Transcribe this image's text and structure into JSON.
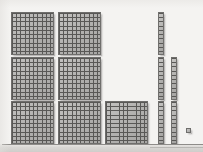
{
  "figure": {
    "title": "Base-ten blocks place value model",
    "description": "Scanned worksheet image showing base-ten manipulative blocks: seven hundred-flats, five ten-rods and one unit cube.",
    "background_color": "#f4f3f1",
    "block_fill_color": "#b4b3b1",
    "grid_line_color": "#595856",
    "block_border_color": "#6f6e6c"
  },
  "blocks": {
    "flats": {
      "label": "hundred-flat",
      "unit_value": 100,
      "count": 7,
      "grid": "10 x 10",
      "items": [
        {
          "name": "flat-1",
          "row": 1,
          "col": 1,
          "x": 11,
          "y": 12
        },
        {
          "name": "flat-2",
          "row": 1,
          "col": 2,
          "x": 58,
          "y": 12
        },
        {
          "name": "flat-3",
          "row": 2,
          "col": 1,
          "x": 11,
          "y": 57
        },
        {
          "name": "flat-4",
          "row": 2,
          "col": 2,
          "x": 58,
          "y": 57
        },
        {
          "name": "flat-5",
          "row": 3,
          "col": 1,
          "x": 11,
          "y": 101
        },
        {
          "name": "flat-6",
          "row": 3,
          "col": 2,
          "x": 58,
          "y": 101
        },
        {
          "name": "flat-7",
          "row": 3,
          "col": 3,
          "x": 105,
          "y": 101
        }
      ]
    },
    "rods": {
      "label": "ten-rod",
      "unit_value": 10,
      "count": 5,
      "grid": "1 x 10",
      "items": [
        {
          "name": "rod-1",
          "x": 158,
          "y": 12
        },
        {
          "name": "rod-2",
          "x": 158,
          "y": 57
        },
        {
          "name": "rod-3",
          "x": 171,
          "y": 57
        },
        {
          "name": "rod-4",
          "x": 158,
          "y": 101
        },
        {
          "name": "rod-5",
          "x": 171,
          "y": 101
        }
      ]
    },
    "units": {
      "label": "unit-cube",
      "unit_value": 1,
      "count": 1,
      "grid": "1 x 1",
      "items": [
        {
          "name": "unit-1",
          "x": 186,
          "y": 128
        }
      ]
    }
  },
  "totals": {
    "hundreds": 7,
    "tens": 5,
    "ones": 1,
    "value": 751
  }
}
